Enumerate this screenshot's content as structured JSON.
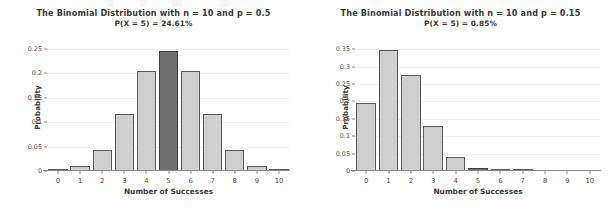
{
  "figure": {
    "background_color": "#ffffff",
    "bar_color": "#cfcfcf",
    "bar_edge_color": "#5a5a5a",
    "highlight_color": "#6e6e6e",
    "highlight_edge_color": "#3f3f3f",
    "gridline_color": "#f0f0f0",
    "axis_color": "#8a8a8a"
  },
  "chart_data": [
    {
      "type": "bar",
      "title": "The Binomial Distribution with n = 10 and p = 0.5",
      "subtitle": "P(X = 5) = 24.61%",
      "xlabel": "Number of Successes",
      "ylabel": "Probability",
      "categories": [
        "0",
        "1",
        "2",
        "3",
        "4",
        "5",
        "6",
        "7",
        "8",
        "9",
        "10"
      ],
      "values": [
        0.001,
        0.0098,
        0.0439,
        0.1172,
        0.2051,
        0.2461,
        0.2051,
        0.1172,
        0.0439,
        0.0098,
        0.001
      ],
      "yticks": [
        "0",
        "0.05",
        "0.1",
        "0.15",
        "0.2",
        "0.25"
      ],
      "ytick_values": [
        0,
        0.05,
        0.1,
        0.15,
        0.2,
        0.25
      ],
      "ylim": [
        0,
        0.26
      ],
      "xlim": [
        -0.5,
        10.5
      ],
      "highlight_index": 5,
      "grid": true,
      "legend": "none"
    },
    {
      "type": "bar",
      "title": "The Binomial Distribution with n = 10 and p = 0.15",
      "subtitle": "P(X = 5) = 0.85%",
      "xlabel": "Number of Successes",
      "ylabel": "Probability",
      "categories": [
        "0",
        "1",
        "2",
        "3",
        "4",
        "5",
        "6",
        "7",
        "8",
        "9",
        "10"
      ],
      "values": [
        0.1969,
        0.3474,
        0.2759,
        0.1298,
        0.0401,
        0.0085,
        0.0012,
        0.0001,
        0.0,
        0.0,
        0.0
      ],
      "yticks": [
        "0",
        "0.05",
        "0.1",
        "0.15",
        "0.2",
        "0.25",
        "0.3",
        "0.35"
      ],
      "ytick_values": [
        0,
        0.05,
        0.1,
        0.15,
        0.2,
        0.25,
        0.3,
        0.35
      ],
      "ylim": [
        0,
        0.365
      ],
      "xlim": [
        -0.5,
        10.5
      ],
      "highlight_index": 5,
      "grid": true,
      "legend": "none"
    }
  ]
}
